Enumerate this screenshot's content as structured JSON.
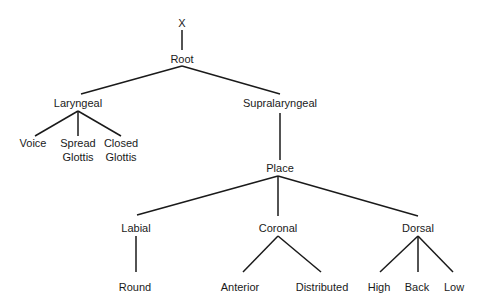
{
  "diagram": {
    "type": "tree",
    "title": "",
    "nodes": [
      {
        "id": "x",
        "label": "X",
        "x": 182,
        "y": 24
      },
      {
        "id": "root",
        "label": "Root",
        "x": 182,
        "y": 60
      },
      {
        "id": "laryngeal",
        "label": "Laryngeal",
        "x": 78,
        "y": 104
      },
      {
        "id": "supralaryngeal",
        "label": "Supralaryngeal",
        "x": 280,
        "y": 104
      },
      {
        "id": "voice",
        "label": "Voice",
        "x": 33,
        "y": 144
      },
      {
        "id": "spread_glottis",
        "label": "Spread",
        "label2": "Glottis",
        "x": 78,
        "y": 144
      },
      {
        "id": "closed_glottis",
        "label": "Closed",
        "label2": "Glottis",
        "x": 121,
        "y": 144
      },
      {
        "id": "place",
        "label": "Place",
        "x": 280,
        "y": 169
      },
      {
        "id": "labial",
        "label": "Labial",
        "x": 136,
        "y": 229
      },
      {
        "id": "coronal",
        "label": "Coronal",
        "x": 278,
        "y": 229
      },
      {
        "id": "dorsal",
        "label": "Dorsal",
        "x": 418,
        "y": 229
      },
      {
        "id": "round",
        "label": "Round",
        "x": 135,
        "y": 288
      },
      {
        "id": "anterior",
        "label": "Anterior",
        "x": 240,
        "y": 288
      },
      {
        "id": "distributed",
        "label": "Distributed",
        "x": 322,
        "y": 288
      },
      {
        "id": "high",
        "label": "High",
        "x": 379,
        "y": 288
      },
      {
        "id": "back",
        "label": "Back",
        "x": 417,
        "y": 288
      },
      {
        "id": "low",
        "label": "Low",
        "x": 454,
        "y": 288
      }
    ],
    "edges": [
      {
        "from": "x",
        "to": "root",
        "x1": 182,
        "y1": 30,
        "x2": 182,
        "y2": 50
      },
      {
        "from": "root",
        "to": "laryngeal",
        "x1": 182,
        "y1": 66,
        "x2": 81,
        "y2": 94
      },
      {
        "from": "root",
        "to": "supralaryngeal",
        "x1": 182,
        "y1": 66,
        "x2": 280,
        "y2": 94
      },
      {
        "from": "laryngeal",
        "to": "voice",
        "x1": 78,
        "y1": 111,
        "x2": 35,
        "y2": 136
      },
      {
        "from": "laryngeal",
        "to": "spread_glottis",
        "x1": 78,
        "y1": 111,
        "x2": 78,
        "y2": 136
      },
      {
        "from": "laryngeal",
        "to": "closed_glottis",
        "x1": 78,
        "y1": 111,
        "x2": 121,
        "y2": 136
      },
      {
        "from": "supralaryngeal",
        "to": "place",
        "x1": 280,
        "y1": 113,
        "x2": 280,
        "y2": 160
      },
      {
        "from": "place",
        "to": "labial",
        "x1": 278,
        "y1": 176,
        "x2": 137,
        "y2": 215
      },
      {
        "from": "place",
        "to": "coronal",
        "x1": 278,
        "y1": 176,
        "x2": 278,
        "y2": 216
      },
      {
        "from": "place",
        "to": "dorsal",
        "x1": 278,
        "y1": 176,
        "x2": 418,
        "y2": 216
      },
      {
        "from": "labial",
        "to": "round",
        "x1": 136,
        "y1": 236,
        "x2": 136,
        "y2": 272
      },
      {
        "from": "coronal",
        "to": "anterior",
        "x1": 278,
        "y1": 236,
        "x2": 243,
        "y2": 272
      },
      {
        "from": "coronal",
        "to": "distributed",
        "x1": 278,
        "y1": 236,
        "x2": 321,
        "y2": 272
      },
      {
        "from": "dorsal",
        "to": "high",
        "x1": 418,
        "y1": 236,
        "x2": 380,
        "y2": 272
      },
      {
        "from": "dorsal",
        "to": "back",
        "x1": 418,
        "y1": 236,
        "x2": 418,
        "y2": 272
      },
      {
        "from": "dorsal",
        "to": "low",
        "x1": 418,
        "y1": 236,
        "x2": 453,
        "y2": 272
      }
    ]
  }
}
